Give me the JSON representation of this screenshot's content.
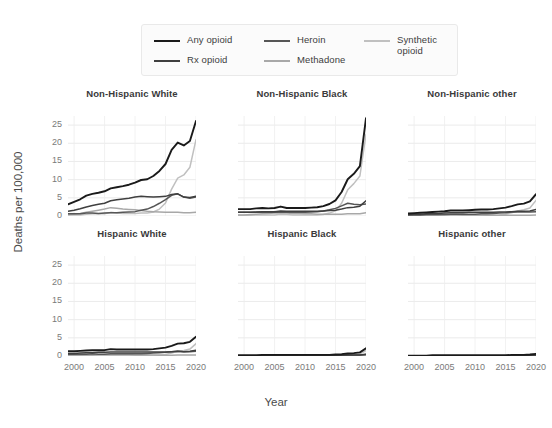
{
  "legend": {
    "entries": [
      {
        "label": "Any opioid",
        "color": "#1a1a1a",
        "col": 0,
        "row": 0
      },
      {
        "label": "Rx opioid",
        "color": "#3f3f3f",
        "col": 0,
        "row": 1
      },
      {
        "label": "Heroin",
        "color": "#565656",
        "col": 1,
        "row": 0
      },
      {
        "label": "Methadone",
        "color": "#a8a8a8",
        "col": 1,
        "row": 1
      },
      {
        "label": "Synthetic opioid",
        "color": "#c0c0c0",
        "col": 2,
        "row": 0
      }
    ]
  },
  "axes": {
    "ylabel": "Deaths per 100,000",
    "xlabel": "Year",
    "yticks": [
      0,
      5,
      10,
      15,
      20,
      25
    ],
    "xticks": [
      2000,
      2005,
      2010,
      2015,
      2020
    ],
    "ylim": [
      0,
      27.5
    ],
    "xlim": [
      1999,
      2020
    ]
  },
  "chart_data": {
    "type": "line",
    "title": "",
    "xlabel": "Year",
    "ylabel": "Deaths per 100,000",
    "ylim": [
      0,
      27.5
    ],
    "xlim": [
      1999,
      2020
    ],
    "grid": true,
    "legend_position": "top",
    "facet_layout": {
      "rows": 2,
      "cols": 3
    },
    "x": [
      1999,
      2000,
      2001,
      2002,
      2003,
      2004,
      2005,
      2006,
      2007,
      2008,
      2009,
      2010,
      2011,
      2012,
      2013,
      2014,
      2015,
      2016,
      2017,
      2018,
      2019,
      2020
    ],
    "panels": [
      {
        "name": "Non-Hispanic White",
        "row": 0,
        "col": 0,
        "series": [
          {
            "name": "Any opioid",
            "color": "#1a1a1a",
            "values": [
              3.2,
              3.9,
              4.6,
              5.6,
              6.1,
              6.4,
              6.8,
              7.6,
              7.9,
              8.2,
              8.6,
              9.2,
              9.9,
              10.1,
              11.0,
              12.4,
              14.3,
              18.2,
              20.2,
              19.4,
              20.6,
              26.1
            ]
          },
          {
            "name": "Rx opioid",
            "color": "#3f3f3f",
            "values": [
              1.3,
              1.6,
              2.0,
              2.5,
              2.9,
              3.2,
              3.5,
              4.2,
              4.5,
              4.7,
              4.9,
              5.2,
              5.4,
              5.3,
              5.2,
              5.3,
              5.4,
              5.9,
              6.1,
              5.2,
              5.1,
              5.4
            ]
          },
          {
            "name": "Heroin",
            "color": "#565656",
            "values": [
              0.6,
              0.6,
              0.6,
              0.8,
              0.8,
              0.7,
              0.8,
              0.9,
              0.9,
              1.0,
              1.1,
              1.2,
              1.6,
              1.9,
              2.6,
              3.5,
              4.5,
              5.7,
              6.1,
              5.2,
              4.9,
              5.2
            ]
          },
          {
            "name": "Methadone",
            "color": "#a8a8a8",
            "values": [
              0.4,
              0.5,
              0.7,
              1.0,
              1.3,
              1.6,
              1.9,
              2.3,
              2.1,
              1.9,
              1.8,
              1.7,
              1.5,
              1.3,
              1.2,
              1.1,
              1.0,
              1.0,
              1.0,
              0.9,
              0.9,
              1.0
            ]
          },
          {
            "name": "Synthetic opioid",
            "color": "#c0c0c0",
            "values": [
              0.3,
              0.3,
              0.3,
              0.5,
              0.6,
              0.6,
              0.6,
              1.0,
              0.8,
              0.7,
              0.7,
              0.7,
              0.8,
              0.8,
              1.1,
              1.9,
              3.6,
              7.4,
              10.4,
              11.3,
              13.4,
              21.0
            ]
          }
        ]
      },
      {
        "name": "Non-Hispanic Black",
        "row": 0,
        "col": 1,
        "series": [
          {
            "name": "Any opioid",
            "color": "#1a1a1a",
            "values": [
              1.9,
              1.9,
              1.9,
              2.1,
              2.2,
              2.1,
              2.2,
              2.6,
              2.2,
              2.2,
              2.2,
              2.2,
              2.3,
              2.4,
              2.7,
              3.3,
              4.3,
              6.6,
              10.1,
              11.6,
              13.7,
              26.9
            ]
          },
          {
            "name": "Rx opioid",
            "color": "#3f3f3f",
            "values": [
              1.0,
              1.0,
              1.0,
              1.1,
              1.2,
              1.2,
              1.2,
              1.4,
              1.3,
              1.3,
              1.3,
              1.3,
              1.3,
              1.3,
              1.4,
              1.5,
              1.6,
              1.9,
              2.3,
              2.4,
              2.7,
              4.2
            ]
          },
          {
            "name": "Heroin",
            "color": "#565656",
            "values": [
              1.0,
              1.0,
              1.0,
              1.0,
              1.1,
              1.0,
              1.0,
              1.1,
              1.0,
              1.0,
              1.0,
              1.0,
              1.1,
              1.2,
              1.4,
              1.7,
              2.1,
              2.8,
              3.5,
              3.2,
              3.1,
              3.3
            ]
          },
          {
            "name": "Methadone",
            "color": "#a8a8a8",
            "values": [
              0.3,
              0.3,
              0.4,
              0.5,
              0.6,
              0.7,
              0.8,
              0.9,
              0.8,
              0.7,
              0.7,
              0.6,
              0.6,
              0.5,
              0.5,
              0.5,
              0.5,
              0.5,
              0.6,
              0.6,
              0.6,
              0.9
            ]
          },
          {
            "name": "Synthetic opioid",
            "color": "#c0c0c0",
            "values": [
              0.2,
              0.2,
              0.2,
              0.3,
              0.3,
              0.3,
              0.3,
              0.5,
              0.4,
              0.3,
              0.3,
              0.3,
              0.3,
              0.3,
              0.4,
              0.8,
              1.4,
              3.5,
              7.2,
              8.9,
              11.0,
              22.5
            ]
          }
        ]
      },
      {
        "name": "Non-Hispanic other",
        "row": 0,
        "col": 2,
        "series": [
          {
            "name": "Any opioid",
            "color": "#1a1a1a",
            "values": [
              0.7,
              0.8,
              0.9,
              1.0,
              1.1,
              1.2,
              1.3,
              1.5,
              1.5,
              1.5,
              1.6,
              1.7,
              1.8,
              1.8,
              1.9,
              2.1,
              2.3,
              2.7,
              3.2,
              3.4,
              4.0,
              6.0
            ]
          },
          {
            "name": "Rx opioid",
            "color": "#3f3f3f",
            "values": [
              0.4,
              0.5,
              0.5,
              0.6,
              0.7,
              0.7,
              0.8,
              0.9,
              0.9,
              0.9,
              1.0,
              1.0,
              1.0,
              1.0,
              1.0,
              1.1,
              1.1,
              1.2,
              1.3,
              1.3,
              1.4,
              1.8
            ]
          },
          {
            "name": "Heroin",
            "color": "#565656",
            "values": [
              0.3,
              0.3,
              0.3,
              0.4,
              0.4,
              0.4,
              0.4,
              0.5,
              0.5,
              0.5,
              0.5,
              0.5,
              0.6,
              0.6,
              0.7,
              0.8,
              0.9,
              1.1,
              1.2,
              1.1,
              1.1,
              1.2
            ]
          },
          {
            "name": "Methadone",
            "color": "#a8a8a8",
            "values": [
              0.1,
              0.1,
              0.2,
              0.2,
              0.3,
              0.3,
              0.4,
              0.4,
              0.4,
              0.3,
              0.3,
              0.3,
              0.3,
              0.2,
              0.2,
              0.2,
              0.2,
              0.2,
              0.2,
              0.2,
              0.2,
              0.3
            ]
          },
          {
            "name": "Synthetic opioid",
            "color": "#c0c0c0",
            "values": [
              0.1,
              0.1,
              0.1,
              0.1,
              0.2,
              0.2,
              0.2,
              0.2,
              0.2,
              0.2,
              0.2,
              0.2,
              0.2,
              0.2,
              0.2,
              0.3,
              0.5,
              0.9,
              1.4,
              1.7,
              2.2,
              4.3
            ]
          }
        ]
      },
      {
        "name": "Hispanic White",
        "row": 1,
        "col": 0,
        "series": [
          {
            "name": "Any opioid",
            "color": "#1a1a1a",
            "values": [
              1.3,
              1.3,
              1.4,
              1.5,
              1.6,
              1.6,
              1.6,
              1.9,
              1.8,
              1.8,
              1.8,
              1.8,
              1.8,
              1.8,
              1.9,
              2.1,
              2.3,
              2.8,
              3.4,
              3.5,
              3.9,
              5.3
            ]
          },
          {
            "name": "Rx opioid",
            "color": "#3f3f3f",
            "values": [
              0.7,
              0.7,
              0.8,
              0.9,
              0.9,
              1.0,
              1.0,
              1.1,
              1.1,
              1.1,
              1.1,
              1.1,
              1.1,
              1.1,
              1.1,
              1.1,
              1.1,
              1.2,
              1.3,
              1.2,
              1.3,
              1.6
            ]
          },
          {
            "name": "Heroin",
            "color": "#565656",
            "values": [
              0.5,
              0.5,
              0.5,
              0.5,
              0.6,
              0.5,
              0.5,
              0.6,
              0.6,
              0.6,
              0.6,
              0.6,
              0.6,
              0.7,
              0.8,
              0.9,
              1.0,
              1.2,
              1.3,
              1.2,
              1.2,
              1.3
            ]
          },
          {
            "name": "Methadone",
            "color": "#a8a8a8",
            "values": [
              0.2,
              0.2,
              0.2,
              0.3,
              0.3,
              0.4,
              0.4,
              0.5,
              0.4,
              0.4,
              0.4,
              0.3,
              0.3,
              0.3,
              0.3,
              0.2,
              0.2,
              0.2,
              0.3,
              0.3,
              0.3,
              0.3
            ]
          },
          {
            "name": "Synthetic opioid",
            "color": "#c0c0c0",
            "values": [
              0.1,
              0.1,
              0.1,
              0.2,
              0.2,
              0.2,
              0.2,
              0.3,
              0.2,
              0.2,
              0.2,
              0.2,
              0.2,
              0.2,
              0.2,
              0.3,
              0.4,
              0.8,
              1.3,
              1.5,
              1.9,
              3.4
            ]
          }
        ]
      },
      {
        "name": "Hispanic Black",
        "row": 1,
        "col": 1,
        "series": [
          {
            "name": "Any opioid",
            "color": "#1a1a1a",
            "values": [
              0.2,
              0.2,
              0.2,
              0.2,
              0.3,
              0.3,
              0.3,
              0.3,
              0.3,
              0.3,
              0.3,
              0.3,
              0.3,
              0.3,
              0.3,
              0.3,
              0.4,
              0.5,
              0.7,
              0.8,
              1.0,
              2.1
            ]
          },
          {
            "name": "Rx opioid",
            "color": "#3f3f3f",
            "values": [
              0.1,
              0.1,
              0.1,
              0.1,
              0.1,
              0.1,
              0.1,
              0.2,
              0.2,
              0.2,
              0.2,
              0.2,
              0.2,
              0.2,
              0.2,
              0.2,
              0.2,
              0.2,
              0.3,
              0.3,
              0.3,
              0.5
            ]
          },
          {
            "name": "Heroin",
            "color": "#565656",
            "values": [
              0.1,
              0.1,
              0.1,
              0.1,
              0.1,
              0.1,
              0.1,
              0.1,
              0.1,
              0.1,
              0.1,
              0.1,
              0.1,
              0.1,
              0.1,
              0.2,
              0.2,
              0.2,
              0.3,
              0.3,
              0.3,
              0.4
            ]
          },
          {
            "name": "Methadone",
            "color": "#a8a8a8",
            "values": [
              0.0,
              0.0,
              0.0,
              0.1,
              0.1,
              0.1,
              0.1,
              0.1,
              0.1,
              0.1,
              0.1,
              0.1,
              0.1,
              0.0,
              0.0,
              0.0,
              0.0,
              0.0,
              0.1,
              0.1,
              0.1,
              0.1
            ]
          },
          {
            "name": "Synthetic opioid",
            "color": "#c0c0c0",
            "values": [
              0.0,
              0.0,
              0.0,
              0.0,
              0.0,
              0.0,
              0.0,
              0.1,
              0.0,
              0.0,
              0.0,
              0.0,
              0.0,
              0.0,
              0.0,
              0.1,
              0.1,
              0.2,
              0.3,
              0.4,
              0.6,
              1.5
            ]
          }
        ]
      },
      {
        "name": "Hispanic other",
        "row": 1,
        "col": 2,
        "series": [
          {
            "name": "Any opioid",
            "color": "#1a1a1a",
            "values": [
              0.1,
              0.1,
              0.1,
              0.1,
              0.2,
              0.2,
              0.2,
              0.2,
              0.2,
              0.2,
              0.2,
              0.2,
              0.2,
              0.2,
              0.2,
              0.2,
              0.2,
              0.3,
              0.3,
              0.3,
              0.4,
              0.6
            ]
          },
          {
            "name": "Rx opioid",
            "color": "#3f3f3f",
            "values": [
              0.1,
              0.1,
              0.1,
              0.1,
              0.1,
              0.1,
              0.1,
              0.1,
              0.1,
              0.1,
              0.1,
              0.1,
              0.1,
              0.1,
              0.1,
              0.1,
              0.1,
              0.1,
              0.2,
              0.2,
              0.2,
              0.3
            ]
          },
          {
            "name": "Heroin",
            "color": "#565656",
            "values": [
              0.0,
              0.0,
              0.0,
              0.0,
              0.1,
              0.1,
              0.1,
              0.1,
              0.1,
              0.1,
              0.1,
              0.1,
              0.1,
              0.1,
              0.1,
              0.1,
              0.1,
              0.1,
              0.1,
              0.1,
              0.1,
              0.2
            ]
          },
          {
            "name": "Methadone",
            "color": "#a8a8a8",
            "values": [
              0.0,
              0.0,
              0.0,
              0.0,
              0.0,
              0.0,
              0.0,
              0.1,
              0.0,
              0.0,
              0.0,
              0.0,
              0.0,
              0.0,
              0.0,
              0.0,
              0.0,
              0.0,
              0.0,
              0.0,
              0.0,
              0.1
            ]
          },
          {
            "name": "Synthetic opioid",
            "color": "#c0c0c0",
            "values": [
              0.0,
              0.0,
              0.0,
              0.0,
              0.0,
              0.0,
              0.0,
              0.0,
              0.0,
              0.0,
              0.0,
              0.0,
              0.0,
              0.0,
              0.0,
              0.0,
              0.1,
              0.1,
              0.1,
              0.1,
              0.2,
              0.4
            ]
          }
        ]
      }
    ]
  }
}
